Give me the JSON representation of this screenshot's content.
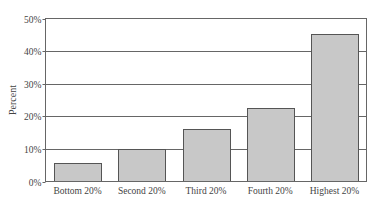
{
  "chart_data": {
    "type": "bar",
    "title": "",
    "xlabel": "",
    "ylabel": "Percent",
    "categories": [
      "Bottom 20%",
      "Second 20%",
      "Third 20%",
      "Fourth 20%",
      "Highest 20%"
    ],
    "values": [
      5.6,
      10.0,
      16.0,
      22.6,
      45.1
    ],
    "unit": "%",
    "ylim": [
      0,
      50
    ],
    "yticks": [
      0,
      10,
      20,
      30,
      40,
      50
    ],
    "ytick_labels": [
      "0%",
      "10%",
      "20%",
      "30%",
      "40%",
      "50%"
    ],
    "grid": true,
    "legend": null,
    "colors": {
      "bar_fill": "#c8c8c8",
      "bar_stroke": "#555555",
      "axis": "#666666"
    }
  }
}
